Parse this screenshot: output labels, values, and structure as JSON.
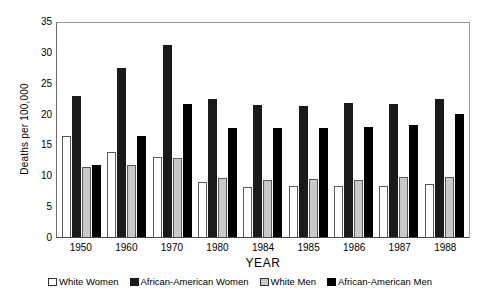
{
  "chart_data": {
    "type": "bar",
    "title": "",
    "xlabel": "YEAR",
    "ylabel": "Deaths per 100,000",
    "categories": [
      "1950",
      "1960",
      "1970",
      "1980",
      "1984",
      "1985",
      "1986",
      "1987",
      "1988"
    ],
    "ylim": [
      0,
      35
    ],
    "yticks": [
      35,
      30,
      25,
      20,
      15,
      10,
      5,
      0
    ],
    "grid": false,
    "legend_position": "bottom",
    "series": [
      {
        "name": "White Women",
        "color": "#ffffff",
        "values": [
          16.3,
          13.8,
          12.9,
          8.9,
          8.1,
          8.2,
          8.2,
          8.2,
          8.6
        ]
      },
      {
        "name": "African-American Women",
        "color": "#1a1a1a",
        "values": [
          22.8,
          27.4,
          31.1,
          22.3,
          21.4,
          21.2,
          21.7,
          21.5,
          22.3
        ]
      },
      {
        "name": "White Men",
        "color": "#c9c9c9",
        "values": [
          11.3,
          11.7,
          12.8,
          9.6,
          9.3,
          9.4,
          9.3,
          9.8,
          9.7
        ]
      },
      {
        "name": "African-American Men",
        "color": "#000000",
        "values": [
          11.6,
          16.3,
          21.5,
          17.7,
          17.6,
          17.6,
          17.9,
          18.2,
          20.0
        ]
      }
    ]
  }
}
